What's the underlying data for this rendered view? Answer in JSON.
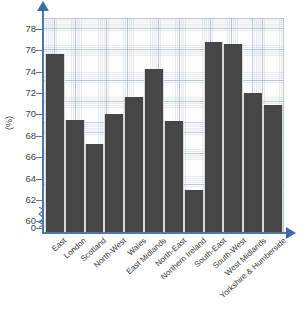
{
  "chart_data": {
    "type": "bar",
    "title": "",
    "xlabel": "",
    "ylabel": "(%)",
    "ylim": [
      59,
      79
    ],
    "grid": true,
    "legend": "none",
    "axis_break": true,
    "y_ticks": [
      "0",
      "60",
      "62",
      "64",
      "66",
      "68",
      "70",
      "72",
      "74",
      "76",
      "78"
    ],
    "categories": [
      "East",
      "London",
      "Scotland",
      "North-West",
      "Wales",
      "East Midlands",
      "North-East",
      "Northern Ireland",
      "South-East",
      "South-West",
      "West Midlands",
      "Yorkshire & Humberside"
    ],
    "values": [
      75.6,
      69.5,
      67.2,
      70.0,
      71.6,
      74.2,
      69.4,
      62.9,
      76.8,
      76.6,
      72.0,
      70.9
    ],
    "bar_color": "#464646",
    "axis_color": "#3a6ea5",
    "grid_color": "#b4c3d7"
  }
}
